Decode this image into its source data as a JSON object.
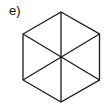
{
  "figure": {
    "label": "e)",
    "shape": "hexagon",
    "stroke_color": "#1a1a1a",
    "stroke_width": 1.3,
    "center": [
      61,
      57
    ],
    "vertices": [
      [
        61,
        12
      ],
      [
        99.5,
        34
      ],
      [
        99.5,
        80
      ],
      [
        61,
        102
      ],
      [
        23,
        80
      ],
      [
        23,
        34
      ]
    ],
    "diagonals": [
      [
        [
          61,
          12
        ],
        [
          61,
          102
        ]
      ],
      [
        [
          23,
          34
        ],
        [
          99.5,
          80
        ]
      ],
      [
        [
          99.5,
          34
        ],
        [
          23,
          80
        ]
      ]
    ]
  }
}
